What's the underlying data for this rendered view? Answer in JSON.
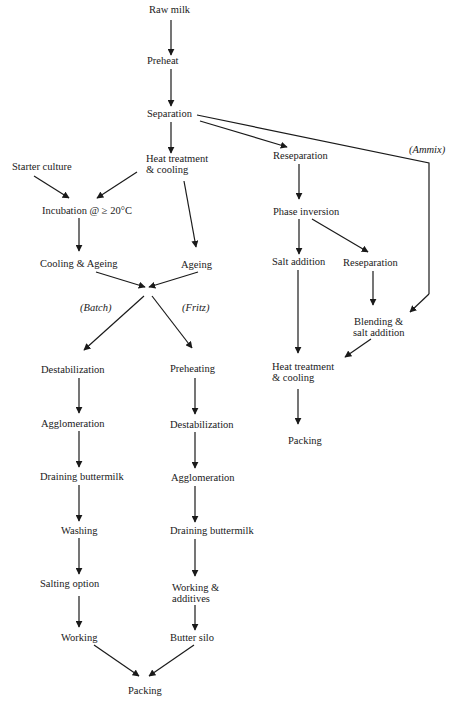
{
  "diagram": {
    "type": "flowchart",
    "nodes": {
      "raw_milk": "Raw milk",
      "preheat": "Preheat",
      "separation": "Separation",
      "heat_treatment_1": "Heat treatment",
      "heat_treatment_1b": "& cooling",
      "starter_culture": "Starter culture",
      "incubation": "Incubation @ ≥ 20°C",
      "cooling_ageing": "Cooling & Ageing",
      "ageing": "Ageing",
      "batch_label": "(Batch)",
      "fritz_label": "(Fritz)",
      "ammix_label": "(Ammix)",
      "batch_destabilization": "Destabilization",
      "batch_agglomeration": "Agglomeration",
      "batch_draining": "Draining buttermilk",
      "batch_washing": "Washing",
      "batch_salting": "Salting option",
      "batch_working": "Working",
      "fritz_preheating": "Preheating",
      "fritz_destabilization": "Destabilization",
      "fritz_agglomeration": "Agglomeration",
      "fritz_draining": "Draining buttermilk",
      "fritz_working": "Working &",
      "fritz_working_b": "additives",
      "fritz_silo": "Butter silo",
      "packing_main": "Packing",
      "reseparation_1": "Reseparation",
      "phase_inversion": "Phase inversion",
      "salt_addition": "Salt addition",
      "reseparation_2": "Reseparation",
      "blending": "Blending &",
      "blending_b": "salt addition",
      "heat_treatment_2": "Heat treatment",
      "heat_treatment_2b": "& cooling",
      "packing_right": "Packing"
    },
    "edges": [
      [
        "Raw milk",
        "Preheat"
      ],
      [
        "Preheat",
        "Separation"
      ],
      [
        "Separation",
        "Heat treatment & cooling"
      ],
      [
        "Separation",
        "Reseparation"
      ],
      [
        "Separation",
        "Blending & salt addition",
        "Ammix"
      ],
      [
        "Starter culture",
        "Incubation @ ≥ 20°C"
      ],
      [
        "Heat treatment & cooling",
        "Incubation @ ≥ 20°C"
      ],
      [
        "Heat treatment & cooling",
        "Ageing"
      ],
      [
        "Incubation @ ≥ 20°C",
        "Cooling & Ageing"
      ],
      [
        "Cooling & Ageing",
        "junction"
      ],
      [
        "Ageing",
        "junction"
      ],
      [
        "junction",
        "Destabilization",
        "Batch"
      ],
      [
        "junction",
        "Preheating",
        "Fritz"
      ],
      [
        "Destabilization",
        "Agglomeration"
      ],
      [
        "Agglomeration",
        "Draining buttermilk"
      ],
      [
        "Draining buttermilk",
        "Washing"
      ],
      [
        "Washing",
        "Salting option"
      ],
      [
        "Salting option",
        "Working"
      ],
      [
        "Working",
        "Packing"
      ],
      [
        "Preheating",
        "Destabilization"
      ],
      [
        "Destabilization",
        "Agglomeration"
      ],
      [
        "Agglomeration",
        "Draining buttermilk"
      ],
      [
        "Draining buttermilk",
        "Working & additives"
      ],
      [
        "Working & additives",
        "Butter silo"
      ],
      [
        "Butter silo",
        "Packing"
      ],
      [
        "Reseparation",
        "Phase inversion"
      ],
      [
        "Phase inversion",
        "Salt addition"
      ],
      [
        "Phase inversion",
        "Reseparation"
      ],
      [
        "Reseparation",
        "Blending & salt addition"
      ],
      [
        "Salt addition",
        "Heat treatment & cooling"
      ],
      [
        "Blending & salt addition",
        "Heat treatment & cooling"
      ],
      [
        "Heat treatment & cooling",
        "Packing"
      ]
    ]
  }
}
